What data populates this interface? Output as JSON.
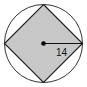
{
  "diagram": {
    "type": "circle-inscribed-square",
    "circle": {
      "cx": 43.5,
      "cy": 43.5,
      "r": 39,
      "stroke": "#333333"
    },
    "square": {
      "fill": "#c8c8c8",
      "stroke": "#222222",
      "vertices": [
        [
          43.5,
          4.5
        ],
        [
          82.5,
          43.5
        ],
        [
          43.5,
          82.5
        ],
        [
          4.5,
          43.5
        ]
      ]
    },
    "center_point": {
      "x": 43.5,
      "y": 43.5,
      "color": "#000000"
    },
    "radius_line": {
      "x1": 43.5,
      "y1": 43.5,
      "x2": 82.5,
      "y2": 43.5
    },
    "radius_label": "14"
  }
}
